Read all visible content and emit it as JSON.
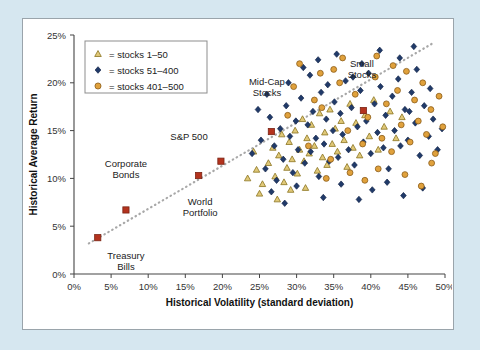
{
  "figure": {
    "background_color": "#d6e7f0",
    "panel_color": "#ffffff",
    "panel_border_color": "#9aa4ab"
  },
  "chart_data": {
    "type": "scatter",
    "title": "",
    "xlabel": "Historical Volatility (standard deviation)",
    "ylabel": "Historical Average Return",
    "xlim": [
      0,
      50
    ],
    "ylim": [
      0,
      25
    ],
    "xticks": [
      0,
      5,
      10,
      15,
      20,
      25,
      30,
      35,
      40,
      45,
      50
    ],
    "xticklabels": [
      "0%",
      "5%",
      "10%",
      "15%",
      "20%",
      "25%",
      "30%",
      "35%",
      "40%",
      "45%",
      "50%"
    ],
    "yticks": [
      0,
      5,
      10,
      15,
      20,
      25
    ],
    "yticklabels": [
      "0%",
      "5%",
      "10%",
      "15%",
      "20%",
      "25%"
    ],
    "grid": false,
    "legend_position": "upper-left",
    "legend": [
      {
        "marker": "triangle",
        "color": "#e0c878",
        "edge": "#8a7320",
        "label": "= stocks 1–50"
      },
      {
        "marker": "diamond",
        "color": "#203a69",
        "edge": "#16264a",
        "label": "= stocks 51–400"
      },
      {
        "marker": "circle",
        "color": "#e0a13c",
        "edge": "#8a5c18",
        "label": "= stocks 401–500"
      }
    ],
    "trendline": {
      "style": "dotted",
      "color": "#a8a8a8",
      "x": [
        2.0,
        48.5
      ],
      "y": [
        3.2,
        24.2
      ]
    },
    "annotated_points": [
      {
        "label": "Treasury\nBills",
        "x": 3.2,
        "y": 3.8,
        "label_x": 7.0,
        "label_y": 1.6,
        "marker": "square",
        "color": "#b4331e"
      },
      {
        "label": "Corporate\nBonds",
        "x": 7.0,
        "y": 6.7,
        "label_x": 7.0,
        "label_y": 11.2,
        "marker": "square",
        "color": "#b4331e"
      },
      {
        "label": "World\nPortfolio",
        "x": 16.8,
        "y": 10.3,
        "label_x": 17.0,
        "label_y": 7.2,
        "marker": "square",
        "color": "#b4331e"
      },
      {
        "label": "S&P 500",
        "x": 19.8,
        "y": 11.8,
        "label_x": 15.5,
        "label_y": 14.0,
        "marker": "square",
        "color": "#b4331e"
      },
      {
        "label": "Mid-Cap\nStocks",
        "x": 26.6,
        "y": 14.9,
        "label_x": 26.0,
        "label_y": 19.8,
        "marker": "square",
        "color": "#b4331e"
      },
      {
        "label": "Small\nStocks",
        "x": 39.0,
        "y": 17.1,
        "label_x": 38.8,
        "label_y": 21.7,
        "marker": "square",
        "color": "#b4331e"
      }
    ],
    "series": [
      {
        "name": "stocks 1-50",
        "marker": "triangle",
        "color": "#e0c878",
        "edge": "#8a7320",
        "points": [
          [
            23.4,
            10.0
          ],
          [
            24.6,
            10.9
          ],
          [
            25.4,
            9.4
          ],
          [
            26.2,
            11.6
          ],
          [
            26.8,
            13.2
          ],
          [
            27.1,
            10.2
          ],
          [
            27.6,
            12.4
          ],
          [
            28.0,
            14.6
          ],
          [
            28.3,
            9.6
          ],
          [
            28.7,
            11.1
          ],
          [
            29.0,
            13.8
          ],
          [
            29.4,
            12.0
          ],
          [
            29.8,
            15.0
          ],
          [
            30.1,
            10.5
          ],
          [
            30.4,
            13.0
          ],
          [
            30.8,
            16.2
          ],
          [
            31.0,
            11.8
          ],
          [
            31.4,
            14.2
          ],
          [
            31.7,
            12.6
          ],
          [
            32.0,
            15.6
          ],
          [
            32.4,
            13.4
          ],
          [
            32.8,
            10.8
          ],
          [
            33.1,
            16.8
          ],
          [
            33.5,
            12.2
          ],
          [
            33.8,
            14.8
          ],
          [
            34.1,
            11.4
          ],
          [
            34.5,
            17.2
          ],
          [
            34.8,
            13.6
          ],
          [
            35.2,
            15.2
          ],
          [
            35.5,
            12.8
          ],
          [
            36.0,
            16.0
          ],
          [
            36.4,
            14.0
          ],
          [
            36.8,
            11.2
          ],
          [
            37.2,
            17.8
          ],
          [
            37.6,
            13.2
          ],
          [
            38.0,
            15.8
          ],
          [
            38.5,
            12.4
          ],
          [
            39.2,
            16.6
          ],
          [
            39.8,
            14.4
          ],
          [
            40.4,
            18.2
          ],
          [
            41.0,
            13.0
          ],
          [
            41.8,
            15.4
          ],
          [
            42.6,
            17.0
          ],
          [
            43.4,
            14.2
          ],
          [
            44.2,
            16.4
          ],
          [
            25.0,
            8.4
          ],
          [
            27.4,
            7.8
          ],
          [
            29.2,
            8.8
          ],
          [
            31.2,
            9.0
          ],
          [
            24.2,
            12.8
          ]
        ]
      },
      {
        "name": "stocks 51-400",
        "marker": "diamond",
        "color": "#203a69",
        "edge": "#16264a",
        "points": [
          [
            24.0,
            12.6
          ],
          [
            25.2,
            14.0
          ],
          [
            25.8,
            11.0
          ],
          [
            26.4,
            16.4
          ],
          [
            27.0,
            13.4
          ],
          [
            27.3,
            9.8
          ],
          [
            27.8,
            15.2
          ],
          [
            28.2,
            12.0
          ],
          [
            28.6,
            17.6
          ],
          [
            29.1,
            14.4
          ],
          [
            29.5,
            10.6
          ],
          [
            29.9,
            16.0
          ],
          [
            30.2,
            13.0
          ],
          [
            30.6,
            18.4
          ],
          [
            31.1,
            11.6
          ],
          [
            31.5,
            15.6
          ],
          [
            31.9,
            12.8
          ],
          [
            32.2,
            17.0
          ],
          [
            32.6,
            14.2
          ],
          [
            33.0,
            10.2
          ],
          [
            33.3,
            19.0
          ],
          [
            33.7,
            13.6
          ],
          [
            34.0,
            16.2
          ],
          [
            34.4,
            11.8
          ],
          [
            34.9,
            15.0
          ],
          [
            35.1,
            18.0
          ],
          [
            35.6,
            12.2
          ],
          [
            35.9,
            16.8
          ],
          [
            36.2,
            14.6
          ],
          [
            36.6,
            20.2
          ],
          [
            37.0,
            13.0
          ],
          [
            37.4,
            17.4
          ],
          [
            37.8,
            11.4
          ],
          [
            38.2,
            15.4
          ],
          [
            38.6,
            19.2
          ],
          [
            39.0,
            13.8
          ],
          [
            39.4,
            16.0
          ],
          [
            39.7,
            21.0
          ],
          [
            40.0,
            12.6
          ],
          [
            40.5,
            17.8
          ],
          [
            40.9,
            14.8
          ],
          [
            41.3,
            19.6
          ],
          [
            41.7,
            13.2
          ],
          [
            42.0,
            16.6
          ],
          [
            42.4,
            11.0
          ],
          [
            42.9,
            18.6
          ],
          [
            43.2,
            15.0
          ],
          [
            43.7,
            20.4
          ],
          [
            44.0,
            13.4
          ],
          [
            44.6,
            17.2
          ],
          [
            45.0,
            14.0
          ],
          [
            45.5,
            19.0
          ],
          [
            46.0,
            15.8
          ],
          [
            46.6,
            12.4
          ],
          [
            47.2,
            17.6
          ],
          [
            47.8,
            14.4
          ],
          [
            48.4,
            16.2
          ],
          [
            49.0,
            13.0
          ],
          [
            49.6,
            15.2
          ],
          [
            46.2,
            21.4
          ],
          [
            24.8,
            17.2
          ],
          [
            26.0,
            18.8
          ],
          [
            28.9,
            20.0
          ],
          [
            30.9,
            21.6
          ],
          [
            32.9,
            22.4
          ],
          [
            35.4,
            23.0
          ],
          [
            38.8,
            22.0
          ],
          [
            41.2,
            23.4
          ],
          [
            43.9,
            22.6
          ],
          [
            45.8,
            23.8
          ],
          [
            26.6,
            8.6
          ],
          [
            28.4,
            7.4
          ],
          [
            30.0,
            9.2
          ],
          [
            33.6,
            8.0
          ],
          [
            36.0,
            9.4
          ],
          [
            38.4,
            7.8
          ],
          [
            40.2,
            8.8
          ],
          [
            42.2,
            9.6
          ],
          [
            44.4,
            8.2
          ],
          [
            47.0,
            9.0
          ],
          [
            31.8,
            20.8
          ],
          [
            34.2,
            19.8
          ],
          [
            37.6,
            20.6
          ],
          [
            45.2,
            17.0
          ],
          [
            48.0,
            19.4
          ]
        ]
      },
      {
        "name": "stocks 401-500",
        "marker": "circle",
        "color": "#e0a13c",
        "edge": "#8a5c18",
        "points": [
          [
            29.6,
            19.6
          ],
          [
            31.6,
            13.4
          ],
          [
            33.4,
            17.4
          ],
          [
            34.6,
            12.0
          ],
          [
            35.8,
            20.0
          ],
          [
            36.9,
            15.0
          ],
          [
            37.9,
            18.8
          ],
          [
            38.9,
            13.6
          ],
          [
            39.6,
            16.4
          ],
          [
            40.6,
            20.6
          ],
          [
            41.5,
            14.2
          ],
          [
            42.1,
            17.8
          ],
          [
            42.8,
            12.8
          ],
          [
            43.6,
            19.2
          ],
          [
            44.1,
            15.6
          ],
          [
            44.8,
            21.2
          ],
          [
            45.3,
            13.8
          ],
          [
            45.9,
            18.2
          ],
          [
            46.4,
            16.0
          ],
          [
            47.0,
            20.0
          ],
          [
            47.5,
            14.6
          ],
          [
            48.1,
            17.2
          ],
          [
            48.7,
            12.6
          ],
          [
            49.2,
            18.6
          ],
          [
            49.7,
            15.4
          ],
          [
            30.4,
            22.0
          ],
          [
            32.4,
            18.2
          ],
          [
            36.2,
            22.6
          ],
          [
            40.8,
            22.8
          ],
          [
            43.0,
            21.8
          ],
          [
            34.0,
            10.0
          ],
          [
            37.2,
            10.6
          ],
          [
            41.0,
            11.0
          ],
          [
            44.6,
            10.4
          ],
          [
            48.2,
            11.6
          ],
          [
            28.8,
            16.6
          ],
          [
            46.8,
            9.2
          ],
          [
            35.0,
            21.4
          ],
          [
            39.2,
            9.8
          ],
          [
            33.2,
            21.0
          ]
        ]
      }
    ]
  },
  "axes": {
    "x_title": "Historical Volatility (standard deviation)",
    "y_title": "Historical Average Return"
  }
}
